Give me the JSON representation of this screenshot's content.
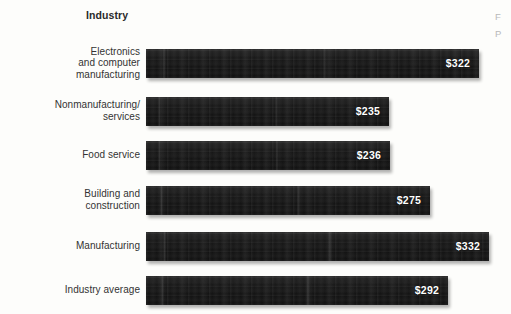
{
  "figure": {
    "column_header": "Industry",
    "margin_note_fragment_1": "F",
    "margin_note_fragment_2": "P",
    "background_color": "#fdfdfb",
    "bar_color": "#151515",
    "value_label_color": "#ffffff",
    "category_label_color": "#333333"
  },
  "chart_data": {
    "type": "bar",
    "orientation": "horizontal",
    "title": "",
    "subtitle": "",
    "xlabel": "",
    "ylabel": "Industry",
    "grid": false,
    "legend": null,
    "axis_visible": false,
    "tick_labels": [],
    "xlim": [
      0,
      350
    ],
    "value_prefix": "$",
    "categories": [
      "Electronics and computer manufacturing",
      "Nonmanufacturing/ services",
      "Food service",
      "Building and construction",
      "Manufacturing",
      "Industry average"
    ],
    "values": [
      322,
      235,
      236,
      275,
      332,
      292
    ],
    "data_labels": [
      "$322",
      "$235",
      "$236",
      "$275",
      "$332",
      "$292"
    ]
  },
  "rows": [
    {
      "label_lines": [
        "Electronics",
        "and computer",
        "manufacturing"
      ],
      "label_text": "Electronics and computer manufacturing",
      "value": 322,
      "value_label": "$322"
    },
    {
      "label_lines": [
        "Nonmanufacturing/",
        "services"
      ],
      "label_text": "Nonmanufacturing/ services",
      "value": 235,
      "value_label": "$235"
    },
    {
      "label_lines": [
        "Food service"
      ],
      "label_text": "Food service",
      "value": 236,
      "value_label": "$236"
    },
    {
      "label_lines": [
        "Building and",
        "construction"
      ],
      "label_text": "Building and construction",
      "value": 275,
      "value_label": "$275"
    },
    {
      "label_lines": [
        "Manufacturing"
      ],
      "label_text": "Manufacturing",
      "value": 332,
      "value_label": "$332"
    },
    {
      "label_lines": [
        "Industry average"
      ],
      "label_text": "Industry average",
      "value": 292,
      "value_label": "$292"
    }
  ]
}
